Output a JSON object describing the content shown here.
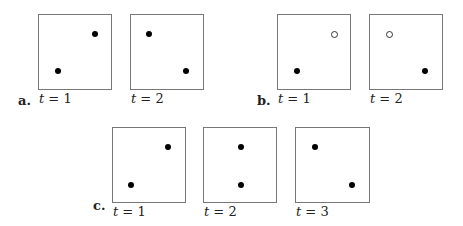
{
  "panels": [
    {
      "label": "a.",
      "label_pos": [
        18,
        93
      ],
      "frames": [
        {
          "caption_t": "t",
          "caption_eq": " = 1",
          "box": [
            38,
            14,
            74,
            76
          ],
          "dots": [
            {
              "x": 56,
              "y": 19,
              "open": false
            },
            {
              "x": 19,
              "y": 56,
              "open": false
            }
          ]
        },
        {
          "caption_t": "t",
          "caption_eq": " = 2",
          "box": [
            130,
            14,
            74,
            76
          ],
          "dots": [
            {
              "x": 18,
              "y": 19,
              "open": false
            },
            {
              "x": 55,
              "y": 56,
              "open": false
            }
          ]
        }
      ]
    },
    {
      "label": "b.",
      "label_pos": [
        257,
        93
      ],
      "frames": [
        {
          "caption_t": "t",
          "caption_eq": " = 1",
          "box": [
            277,
            14,
            74,
            76
          ],
          "dots": [
            {
              "x": 56,
              "y": 19,
              "open": true
            },
            {
              "x": 19,
              "y": 56,
              "open": false
            }
          ]
        },
        {
          "caption_t": "t",
          "caption_eq": " = 2",
          "box": [
            369,
            14,
            74,
            76
          ],
          "dots": [
            {
              "x": 19,
              "y": 19,
              "open": true
            },
            {
              "x": 55,
              "y": 56,
              "open": false
            }
          ]
        }
      ]
    },
    {
      "label": "c.",
      "label_pos": [
        93,
        198
      ],
      "frames": [
        {
          "caption_t": "t",
          "caption_eq": " = 1",
          "box": [
            112,
            127,
            74,
            76
          ],
          "dots": [
            {
              "x": 55,
              "y": 19,
              "open": false
            },
            {
              "x": 18,
              "y": 57,
              "open": false
            }
          ]
        },
        {
          "caption_t": "t",
          "caption_eq": " = 2",
          "box": [
            203,
            127,
            74,
            76
          ],
          "dots": [
            {
              "x": 37,
              "y": 19,
              "open": false
            },
            {
              "x": 37,
              "y": 57,
              "open": false
            }
          ]
        },
        {
          "caption_t": "t",
          "caption_eq": " = 3",
          "box": [
            295,
            127,
            75,
            76
          ],
          "dots": [
            {
              "x": 19,
              "y": 19,
              "open": false
            },
            {
              "x": 56,
              "y": 57,
              "open": false
            }
          ]
        }
      ]
    }
  ]
}
